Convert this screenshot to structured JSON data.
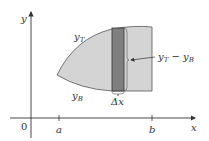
{
  "diagram": {
    "axes": {
      "x_label": "x",
      "y_label": "y",
      "origin_label": "0",
      "ticks": [
        {
          "label": "a"
        },
        {
          "label": "b"
        }
      ]
    },
    "region": {
      "top_curve_label": "y",
      "top_curve_sub": "T",
      "bottom_curve_label": "y",
      "bottom_curve_sub": "B",
      "fill_color": "#d4d4d4",
      "strip_color": "#7f7f7f"
    },
    "strip": {
      "width_label": "Δx",
      "height_label_a": "y",
      "height_label_a_sub": "T",
      "height_label_minus": " − ",
      "height_label_b": "y",
      "height_label_b_sub": "B"
    }
  }
}
